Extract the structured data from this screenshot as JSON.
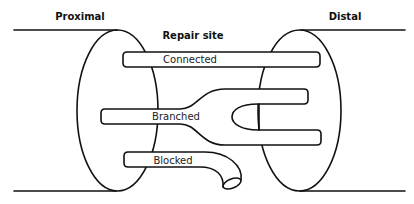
{
  "diagram": {
    "labels": {
      "proximal": "Proximal",
      "distal": "Distal",
      "repair_site": "Repair site"
    },
    "tubes": [
      {
        "id": "connected",
        "label": "Connected"
      },
      {
        "id": "branched",
        "label": "Branched"
      },
      {
        "id": "blocked",
        "label": "Blocked"
      }
    ],
    "colors": {
      "line": "#111111",
      "background": "#ffffff"
    }
  }
}
